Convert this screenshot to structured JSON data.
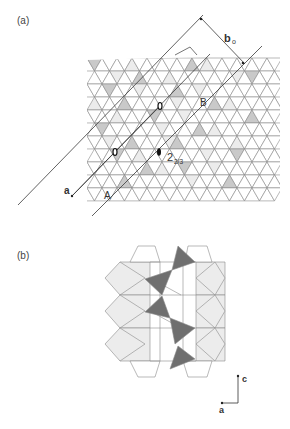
{
  "figure": {
    "panels": [
      {
        "id": "a",
        "label": "(a)",
        "annotations": {
          "axis_b": "b",
          "axis_b_sub": "o",
          "axis_a": "a",
          "point_A": "A",
          "point_B": "B",
          "symmetry_label": "2",
          "symmetry_sub": "2/3"
        },
        "description": "Triangular-tetrahedral sheet projection with shaded tetrahedra, diagonal glide planes and 2-fold screw axis"
      },
      {
        "id": "b",
        "label": "(b)",
        "annotations": {
          "axis_c": "c",
          "axis_a": "a"
        },
        "description": "Side projection of polyhedral layer with dark-shaded tetrahedral chain"
      }
    ],
    "colors": {
      "line": "#8a8a8a",
      "light_fill": "#ececec",
      "mid_fill": "#c9c9c9",
      "dark_fill": "#6f6f6f",
      "axis_line": "#3a3a3a"
    }
  }
}
